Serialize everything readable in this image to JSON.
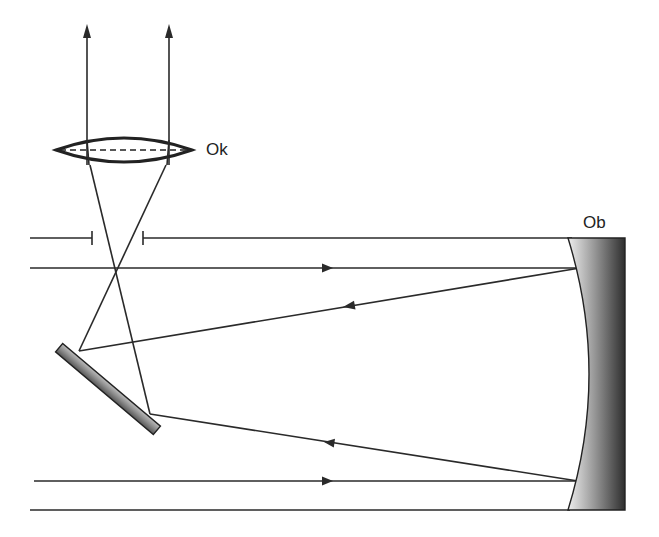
{
  "labels": {
    "eyepiece": "Ok",
    "objective": "Ob"
  },
  "components": [
    {
      "name": "eyepiece-lens",
      "label": "Ok",
      "type": "biconvex lens"
    },
    {
      "name": "objective-mirror",
      "label": "Ob",
      "type": "concave primary mirror"
    },
    {
      "name": "secondary-mirror",
      "type": "flat diagonal mirror"
    },
    {
      "name": "tube",
      "type": "telescope tube walls"
    },
    {
      "name": "field-stop",
      "type": "aperture opening in tube"
    }
  ],
  "rays": [
    {
      "name": "incoming-ray-upper",
      "direction": "right",
      "arrow": true
    },
    {
      "name": "reflected-ray-upper",
      "direction": "left",
      "arrow": true
    },
    {
      "name": "incoming-ray-lower",
      "direction": "right",
      "arrow": true
    },
    {
      "name": "reflected-ray-lower",
      "direction": "left",
      "arrow": true
    },
    {
      "name": "exit-ray-left",
      "direction": "up",
      "arrow": true
    },
    {
      "name": "exit-ray-right",
      "direction": "up",
      "arrow": true
    }
  ],
  "colors": {
    "line": "#2a2a2a",
    "mirror_light": "#e6e6e6",
    "mirror_dark": "#333333",
    "background": "#ffffff"
  }
}
